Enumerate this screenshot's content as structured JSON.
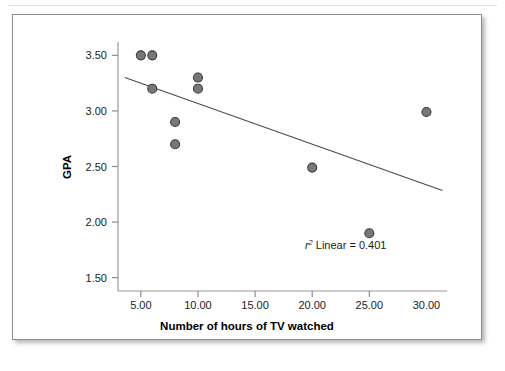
{
  "chart_data": {
    "type": "scatter",
    "title": "",
    "xlabel": "Number of hours of TV watched",
    "ylabel": "GPA",
    "xlim": [
      3.0,
      31.8
    ],
    "ylim": [
      1.38,
      3.62
    ],
    "xticks": [
      5,
      10,
      15,
      20,
      25,
      30
    ],
    "xtick_labels": [
      "5.00",
      "10.00",
      "15.00",
      "20.00",
      "25.00",
      "30.00"
    ],
    "yticks": [
      1.5,
      2.0,
      2.5,
      3.0,
      3.5
    ],
    "ytick_labels": [
      "1.50",
      "2.00",
      "2.50",
      "3.00",
      "3.50"
    ],
    "grid": false,
    "legend": "none",
    "marker_fill": "#77777a",
    "marker_edge": "#3c3c3f",
    "marker_size": 9,
    "points": [
      {
        "x": 5,
        "y": 3.5
      },
      {
        "x": 6,
        "y": 3.5
      },
      {
        "x": 6,
        "y": 3.2
      },
      {
        "x": 8,
        "y": 2.9
      },
      {
        "x": 8,
        "y": 2.7
      },
      {
        "x": 10,
        "y": 3.3
      },
      {
        "x": 10,
        "y": 3.2
      },
      {
        "x": 20,
        "y": 2.49
      },
      {
        "x": 25,
        "y": 1.9
      },
      {
        "x": 30,
        "y": 2.99
      }
    ],
    "fit_line": {
      "x_start": 3.6,
      "y_start": 3.3,
      "x_end": 31.4,
      "y_end": 2.285,
      "color": "#4b4b4d"
    },
    "annotations": [
      {
        "id": "r-squared",
        "prefix": "r",
        "superscript": "2",
        "text": " Linear = 0.401",
        "full_text": "r2 Linear = 0.401",
        "x": 26.5,
        "y": 1.76
      }
    ],
    "axis_color": "#9a9a9a",
    "tick_color": "#8c8c8c"
  }
}
